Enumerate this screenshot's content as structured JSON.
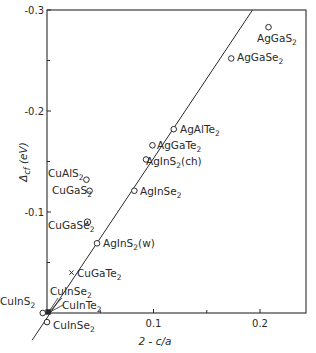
{
  "chart_data": {
    "type": "scatter",
    "title": "",
    "xlabel": "2 - c/a",
    "ylabel": "Δcf (eV)",
    "xlim": [
      0,
      0.24
    ],
    "ylim": [
      0,
      -0.3
    ],
    "x_ticks": [
      {
        "value": 0.1,
        "label": "0.1"
      },
      {
        "value": 0.2,
        "label": "0.2"
      }
    ],
    "x_minor_ticks": [
      0.05,
      0.15
    ],
    "y_ticks": [
      {
        "value": -0.3,
        "label": "-0.3"
      },
      {
        "value": -0.2,
        "label": "-0.2"
      },
      {
        "value": -0.1,
        "label": "-0.1"
      }
    ],
    "y_minor_ticks": [
      -0.25,
      -0.15,
      -0.05
    ],
    "grid": false,
    "legend": null,
    "fit_line": {
      "x": [
        -0.014,
        0.193
      ],
      "y": [
        0.027,
        -0.3
      ]
    },
    "points": [
      {
        "label": "AgGaS",
        "sub": "2",
        "suffix": "",
        "x": 0.208,
        "y": -0.283,
        "marker": "circle"
      },
      {
        "label": "AgGaSe",
        "sub": "2",
        "suffix": "",
        "x": 0.173,
        "y": -0.252,
        "marker": "circle"
      },
      {
        "label": "AgAlTe",
        "sub": "2",
        "suffix": "",
        "x": 0.119,
        "y": -0.182,
        "marker": "circle"
      },
      {
        "label": "AgGaTe",
        "sub": "2",
        "suffix": "",
        "x": 0.099,
        "y": -0.166,
        "marker": "circle"
      },
      {
        "label": "AgInS",
        "sub": "2",
        "suffix": "(ch)",
        "x": 0.093,
        "y": -0.152,
        "marker": "circle"
      },
      {
        "label": "AgInSe",
        "sub": "2",
        "suffix": "",
        "x": 0.082,
        "y": -0.121,
        "marker": "circle"
      },
      {
        "label": "AgInS",
        "sub": "2",
        "suffix": "(w)",
        "x": 0.047,
        "y": -0.069,
        "marker": "circle"
      },
      {
        "label": "CuAlS",
        "sub": "2",
        "suffix": "",
        "x": 0.037,
        "y": -0.132,
        "marker": "circle"
      },
      {
        "label": "CuGaS",
        "sub": "2",
        "suffix": "",
        "x": 0.04,
        "y": -0.121,
        "marker": "circle"
      },
      {
        "label": "CuGaSe",
        "sub": "2",
        "suffix": "",
        "x": 0.038,
        "y": -0.09,
        "marker": "dotted-circle"
      },
      {
        "label": "CuGaTe",
        "sub": "2",
        "suffix": "",
        "x": 0.023,
        "y": -0.04,
        "marker": "cross"
      },
      {
        "label": "CuInSe",
        "sub": "2",
        "suffix": "",
        "x": 0.001,
        "y": -0.001,
        "marker": "filled"
      },
      {
        "label": "CuInTe",
        "sub": "2",
        "suffix": "",
        "x": 0.001,
        "y": -0.001,
        "marker": "filled"
      },
      {
        "label": "CuInS",
        "sub": "2",
        "suffix": "",
        "x": -0.004,
        "y": 0.0,
        "marker": "circle"
      },
      {
        "label": "CuInSe",
        "sub": "2",
        "suffix": "",
        "x": 0.0,
        "y": 0.009,
        "marker": "circle"
      }
    ]
  },
  "colors": {
    "ink": "#2a2a2a",
    "background": "#ffffff"
  }
}
